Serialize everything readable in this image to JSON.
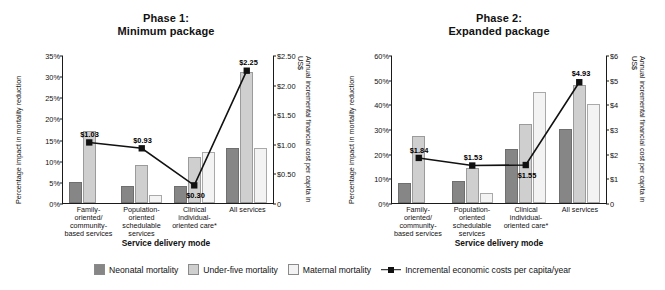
{
  "legend": {
    "items": [
      {
        "label": "Neonatal mortality",
        "icon": "square-swatch-dark-gray",
        "color": "#868686"
      },
      {
        "label": "Under-five mortality",
        "icon": "square-swatch-light-gray",
        "color": "#cfcfcf"
      },
      {
        "label": "Maternal mortality",
        "icon": "square-swatch-very-light-gray",
        "color": "#f3f3f3"
      },
      {
        "label": "Incremental economic costs per capita/year",
        "icon": "line-with-square-marker",
        "color": "#111111"
      }
    ]
  },
  "chart_data": [
    {
      "type": "bar",
      "id": "phase-1",
      "title": "Phase 1:",
      "subtitle": "Minimum package",
      "xlabel": "Service delivery mode",
      "ylabel": "Percentage impact in mortality reduction",
      "y2label": "Annual incremental financial cost per capita in US$",
      "categories": [
        "Family-oriented/ community-based services",
        "Population-oriented schedulable services",
        "Clinical individual-oriented care*",
        "All services"
      ],
      "category_lines": [
        [
          "Family-",
          "oriented/",
          "community-",
          "based services"
        ],
        [
          "Population-",
          "oriented",
          "schedulable",
          "services"
        ],
        [
          "Clinical",
          "individual-",
          "oriented care*"
        ],
        [
          "All services"
        ]
      ],
      "ylim": [
        0,
        35
      ],
      "yticks": [
        "0%",
        "5%",
        "10%",
        "15%",
        "20%",
        "25%",
        "30%",
        "35%"
      ],
      "ytickvalues": [
        0,
        5,
        10,
        15,
        20,
        25,
        30,
        35
      ],
      "y2lim": [
        0,
        2.5
      ],
      "y2ticks": [
        "0",
        "$0.50",
        "$1.00",
        "$1.50",
        "$2.00",
        "$2.50"
      ],
      "y2tickvalues": [
        0,
        0.5,
        1.0,
        1.5,
        2.0,
        2.5
      ],
      "grid": false,
      "legend_position": "bottom",
      "series": [
        {
          "name": "Neonatal mortality",
          "values": [
            5,
            4,
            4,
            13
          ]
        },
        {
          "name": "Under-five mortality",
          "values": [
            17,
            9,
            11,
            31
          ]
        },
        {
          "name": "Maternal mortality",
          "values": [
            0,
            2,
            12,
            13
          ]
        }
      ],
      "line_series": {
        "name": "Incremental economic costs per capita/year",
        "values": [
          1.03,
          0.93,
          0.3,
          2.25
        ],
        "labels": [
          "$1.03",
          "$0.93",
          "$0.30",
          "$2.25"
        ],
        "label_positions": [
          "above",
          "above",
          "below",
          "above"
        ]
      }
    },
    {
      "type": "bar",
      "id": "phase-2",
      "title": "Phase 2:",
      "subtitle": "Expanded package",
      "xlabel": "Service delivery mode",
      "ylabel": "Percentage impact in mortality reduction",
      "y2label": "Annual incremental financial cost per capita in US$",
      "categories": [
        "Family-oriented/ community-based services",
        "Population-oriented schedulable services",
        "Clinical individual-oriented care*",
        "All services"
      ],
      "category_lines": [
        [
          "Family-",
          "oriented/",
          "community-",
          "based services"
        ],
        [
          "Population-",
          "oriented",
          "schedulable",
          "services"
        ],
        [
          "Clinical",
          "individual-",
          "oriented care*"
        ],
        [
          "All services"
        ]
      ],
      "ylim": [
        0,
        60
      ],
      "yticks": [
        "0%",
        "10%",
        "20%",
        "30%",
        "40%",
        "50%",
        "60%"
      ],
      "ytickvalues": [
        0,
        10,
        20,
        30,
        40,
        50,
        60
      ],
      "y2lim": [
        0,
        6
      ],
      "y2ticks": [
        "0",
        "$1",
        "$2",
        "$3",
        "$4",
        "$5",
        "$6"
      ],
      "y2tickvalues": [
        0,
        1,
        2,
        3,
        4,
        5,
        6
      ],
      "grid": false,
      "legend_position": "bottom",
      "series": [
        {
          "name": "Neonatal mortality",
          "values": [
            8,
            9,
            22,
            30
          ]
        },
        {
          "name": "Under-five mortality",
          "values": [
            27,
            14,
            32,
            48
          ]
        },
        {
          "name": "Maternal mortality",
          "values": [
            0,
            4,
            45,
            40
          ]
        }
      ],
      "line_series": {
        "name": "Incremental economic costs per capita/year",
        "values": [
          1.84,
          1.53,
          1.55,
          4.93
        ],
        "labels": [
          "$1.84",
          "$1.53",
          "$1.55",
          "$4.93"
        ],
        "label_positions": [
          "above",
          "above",
          "below",
          "above"
        ]
      }
    }
  ]
}
